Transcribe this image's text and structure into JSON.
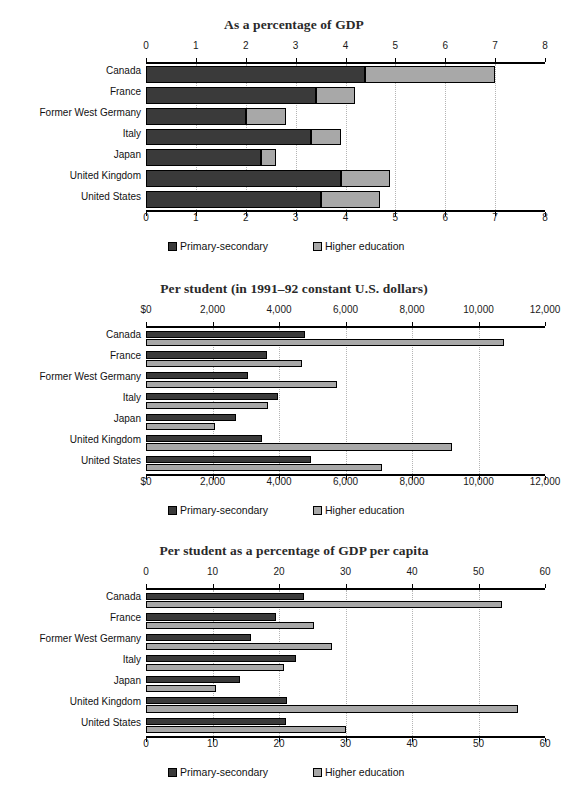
{
  "figure": {
    "categories": [
      "Canada",
      "France",
      "Former West Germany",
      "Italy",
      "Japan",
      "United Kingdom",
      "United States"
    ],
    "legend": {
      "primary_label": "Primary-secondary",
      "higher_label": "Higher education",
      "primary_color": "#3a3a3a",
      "higher_color": "#a8a8a8"
    }
  },
  "chart_data": [
    {
      "type": "bar",
      "orientation": "horizontal",
      "stacked": true,
      "title": "As a percentage of GDP",
      "xlabel": "",
      "ylabel": "",
      "xlim": [
        0,
        8
      ],
      "xticks": [
        0,
        1,
        2,
        3,
        4,
        5,
        6,
        7,
        8
      ],
      "xticklabels": [
        "0",
        "1",
        "2",
        "3",
        "4",
        "5",
        "6",
        "7",
        "8"
      ],
      "grid": true,
      "legend_position": "bottom",
      "categories": [
        "Canada",
        "France",
        "Former West Germany",
        "Italy",
        "Japan",
        "United Kingdom",
        "United States"
      ],
      "series": [
        {
          "name": "Primary-secondary",
          "values": [
            4.4,
            3.4,
            2.0,
            3.3,
            2.3,
            3.9,
            3.5
          ]
        },
        {
          "name": "Higher education",
          "values": [
            2.6,
            0.8,
            0.8,
            0.6,
            0.3,
            1.0,
            1.2
          ]
        }
      ],
      "totals": [
        7.0,
        4.2,
        2.8,
        3.9,
        2.6,
        4.9,
        4.7
      ]
    },
    {
      "type": "bar",
      "orientation": "horizontal",
      "stacked": false,
      "title": "Per student (in 1991–92 constant U.S. dollars)",
      "xlabel": "",
      "ylabel": "",
      "xlim": [
        0,
        12000
      ],
      "xticks": [
        0,
        2000,
        4000,
        6000,
        8000,
        10000,
        12000
      ],
      "xticklabels": [
        "$0",
        "2,000",
        "4,000",
        "6,000",
        "8,000",
        "10,000",
        "12,000"
      ],
      "grid": true,
      "legend_position": "bottom",
      "categories": [
        "Canada",
        "France",
        "Former West Germany",
        "Italy",
        "Japan",
        "United Kingdom",
        "United States"
      ],
      "series": [
        {
          "name": "Primary-secondary",
          "values": [
            4780,
            3650,
            3060,
            3980,
            2720,
            3500,
            4950
          ]
        },
        {
          "name": "Higher education",
          "values": [
            10760,
            4700,
            5750,
            3680,
            2080,
            9200,
            7100
          ]
        }
      ]
    },
    {
      "type": "bar",
      "orientation": "horizontal",
      "stacked": false,
      "title": "Per student as a percentage of GDP per capita",
      "xlabel": "",
      "ylabel": "",
      "xlim": [
        0,
        60
      ],
      "xticks": [
        0,
        10,
        20,
        30,
        40,
        50,
        60
      ],
      "xticklabels": [
        "0",
        "10",
        "20",
        "30",
        "40",
        "50",
        "60"
      ],
      "grid": true,
      "legend_position": "bottom",
      "categories": [
        "Canada",
        "France",
        "Former West Germany",
        "Italy",
        "Japan",
        "United Kingdom",
        "United States"
      ],
      "series": [
        {
          "name": "Primary-secondary",
          "values": [
            23.8,
            19.6,
            15.8,
            22.6,
            14.2,
            21.2,
            21.0
          ]
        },
        {
          "name": "Higher education",
          "values": [
            53.6,
            25.2,
            28.0,
            20.8,
            10.6,
            56.0,
            30.0
          ]
        }
      ]
    }
  ]
}
